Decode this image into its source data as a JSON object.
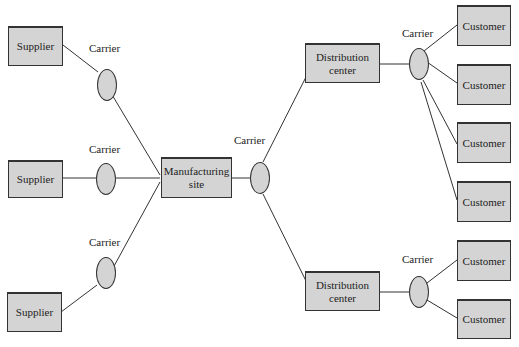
{
  "diagram": {
    "type": "supply-chain-network",
    "suppliers": [
      {
        "label": "Supplier"
      },
      {
        "label": "Supplier"
      },
      {
        "label": "Supplier"
      }
    ],
    "carriers_in": [
      {
        "label": "Carrier"
      },
      {
        "label": "Carrier"
      },
      {
        "label": "Carrier"
      }
    ],
    "manufacturing": {
      "label": "Manufacturing site"
    },
    "carrier_mid": {
      "label": "Carrier"
    },
    "distribution_centers": [
      {
        "label": "Distribution center"
      },
      {
        "label": "Distribution center"
      }
    ],
    "carriers_out": [
      {
        "label": "Carrier"
      },
      {
        "label": "Carrier"
      }
    ],
    "customers": [
      {
        "label": "Customer"
      },
      {
        "label": "Customer"
      },
      {
        "label": "Customer"
      },
      {
        "label": "Customer"
      },
      {
        "label": "Customer"
      },
      {
        "label": "Customer"
      }
    ],
    "colors": {
      "box_fill": "#d4d4d4",
      "stroke": "#333333",
      "background": "#ffffff"
    }
  }
}
